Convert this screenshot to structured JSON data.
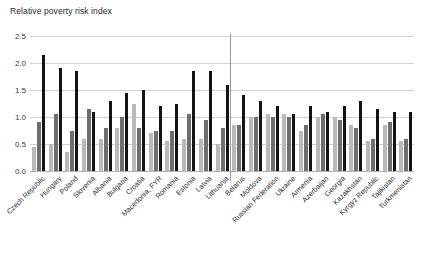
{
  "chart_data": {
    "type": "bar",
    "title": "Relative poverty risk index",
    "xlabel": "",
    "ylabel": "",
    "ylim": [
      0.0,
      2.5
    ],
    "yticks": [
      "0.0",
      "0.5",
      "1.0",
      "1.5",
      "2.0",
      "2.5"
    ],
    "ytick_values": [
      0.0,
      0.5,
      1.0,
      1.5,
      2.0,
      2.5
    ],
    "grid": true,
    "legend": "none",
    "group_divider_after_index": 12,
    "categories": [
      "Czech Republic",
      "Hungary",
      "Poland",
      "Slovenia",
      "Albania",
      "Bulgaria",
      "Croatia",
      "Macedonia, FYR",
      "Romania",
      "Estonia",
      "Latvia",
      "Lithuania",
      "Belarus",
      "Moldova",
      "Russian Federation",
      "Ukraine",
      "Armenia",
      "Azerbaijan",
      "Georgia",
      "Kazakhstan",
      "Kyrgyz Republic",
      "Tajikistan",
      "Turkmenistan"
    ],
    "series": [
      {
        "name": "series-1",
        "color": "#b9b9b9",
        "values": [
          0.45,
          0.5,
          0.35,
          0.6,
          0.6,
          0.8,
          1.25,
          0.7,
          0.55,
          0.6,
          0.6,
          0.5,
          0.85,
          1.0,
          1.05,
          1.05,
          0.75,
          1.0,
          1.0,
          0.85,
          0.55,
          0.85,
          0.55
        ]
      },
      {
        "name": "series-2",
        "color": "#6e6e6e",
        "values": [
          0.9,
          1.05,
          0.75,
          1.15,
          0.8,
          1.0,
          0.8,
          0.75,
          0.75,
          1.05,
          0.95,
          0.8,
          0.85,
          1.0,
          1.0,
          1.0,
          0.85,
          1.05,
          0.95,
          0.8,
          0.6,
          0.9,
          0.6
        ]
      },
      {
        "name": "series-3",
        "color": "#141414",
        "values": [
          2.15,
          1.9,
          1.85,
          1.1,
          1.3,
          1.45,
          1.5,
          1.2,
          1.25,
          1.85,
          1.85,
          1.6,
          1.4,
          1.3,
          1.2,
          1.05,
          1.2,
          1.1,
          1.2,
          1.3,
          1.15,
          1.1,
          1.1
        ]
      }
    ]
  }
}
